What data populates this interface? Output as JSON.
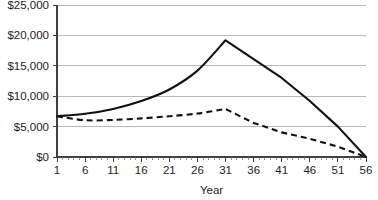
{
  "chart_data": {
    "type": "line",
    "title": "",
    "xlabel": "Year",
    "ylabel": "",
    "xlim": [
      1,
      56
    ],
    "ylim": [
      0,
      25000
    ],
    "grid": true,
    "legend": "none",
    "y_tick_labels": [
      "$0",
      "$5,000",
      "$10,000",
      "$15,000",
      "$20,000",
      "$25,000"
    ],
    "y_tick_values": [
      0,
      5000,
      10000,
      15000,
      20000,
      25000
    ],
    "x_tick_labels": [
      "1",
      "6",
      "11",
      "16",
      "21",
      "26",
      "31",
      "36",
      "41",
      "46",
      "51",
      "56"
    ],
    "x_tick_values": [
      1,
      6,
      11,
      16,
      21,
      26,
      31,
      36,
      41,
      46,
      51,
      56
    ],
    "x_minor_tick_step": 1,
    "x": [
      1,
      6,
      11,
      16,
      21,
      26,
      31,
      36,
      41,
      46,
      51,
      56
    ],
    "series": [
      {
        "name": "solid-series",
        "style": "solid",
        "color": "#111111",
        "values": [
          6700,
          7100,
          7900,
          9200,
          11100,
          14200,
          19200,
          16100,
          13000,
          9200,
          5000,
          0
        ]
      },
      {
        "name": "dashed-series",
        "style": "dashed",
        "color": "#111111",
        "values": [
          6700,
          6050,
          6100,
          6350,
          6700,
          7150,
          7900,
          5600,
          4050,
          3000,
          1700,
          0
        ]
      }
    ]
  },
  "axis": {
    "x_title": "Year"
  }
}
